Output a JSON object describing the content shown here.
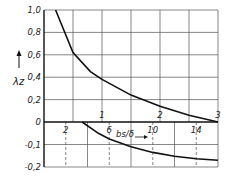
{
  "chart_data": {
    "type": "line",
    "title": "",
    "ylabel": "λz",
    "xlabel_lower": "bs/δ",
    "xlabel_upper": "",
    "ylim": [
      -0.2,
      1.0
    ],
    "grid": true,
    "y_ticks": [
      {
        "v": 1.0,
        "label": "1,0"
      },
      {
        "v": 0.8,
        "label": "0,8"
      },
      {
        "v": 0.6,
        "label": "0,6"
      },
      {
        "v": 0.4,
        "label": "0,4"
      },
      {
        "v": 0.2,
        "label": "0,2"
      },
      {
        "v": 0.0,
        "label": "0"
      },
      {
        "v": -0.1,
        "label": "-0,1"
      },
      {
        "v": -0.2,
        "label": "-0,2"
      }
    ],
    "upper_axis": {
      "range": [
        0,
        3
      ],
      "tick_labels": [
        "1",
        "2",
        "3"
      ],
      "tick_values": [
        1,
        2,
        3
      ],
      "grid_step": 0.5
    },
    "lower_axis": {
      "range": [
        0,
        16
      ],
      "tick_labels": [
        "2",
        "6",
        "10",
        "14"
      ],
      "tick_values": [
        2,
        6,
        10,
        14
      ],
      "grid_step": 2
    },
    "series": [
      {
        "name": "upper curve (λz vs upper scale)",
        "x": [
          0.2,
          0.5,
          0.8,
          1.0,
          1.5,
          2.0,
          2.5,
          3.0
        ],
        "y": [
          1.0,
          0.62,
          0.45,
          0.38,
          0.24,
          0.14,
          0.06,
          0.0
        ]
      },
      {
        "name": "lower curve (λz vs bs/δ)",
        "x": [
          3.5,
          5,
          6,
          8,
          10,
          12,
          14,
          16
        ],
        "y": [
          0.0,
          -0.05,
          -0.075,
          -0.11,
          -0.135,
          -0.152,
          -0.163,
          -0.17
        ]
      }
    ]
  }
}
